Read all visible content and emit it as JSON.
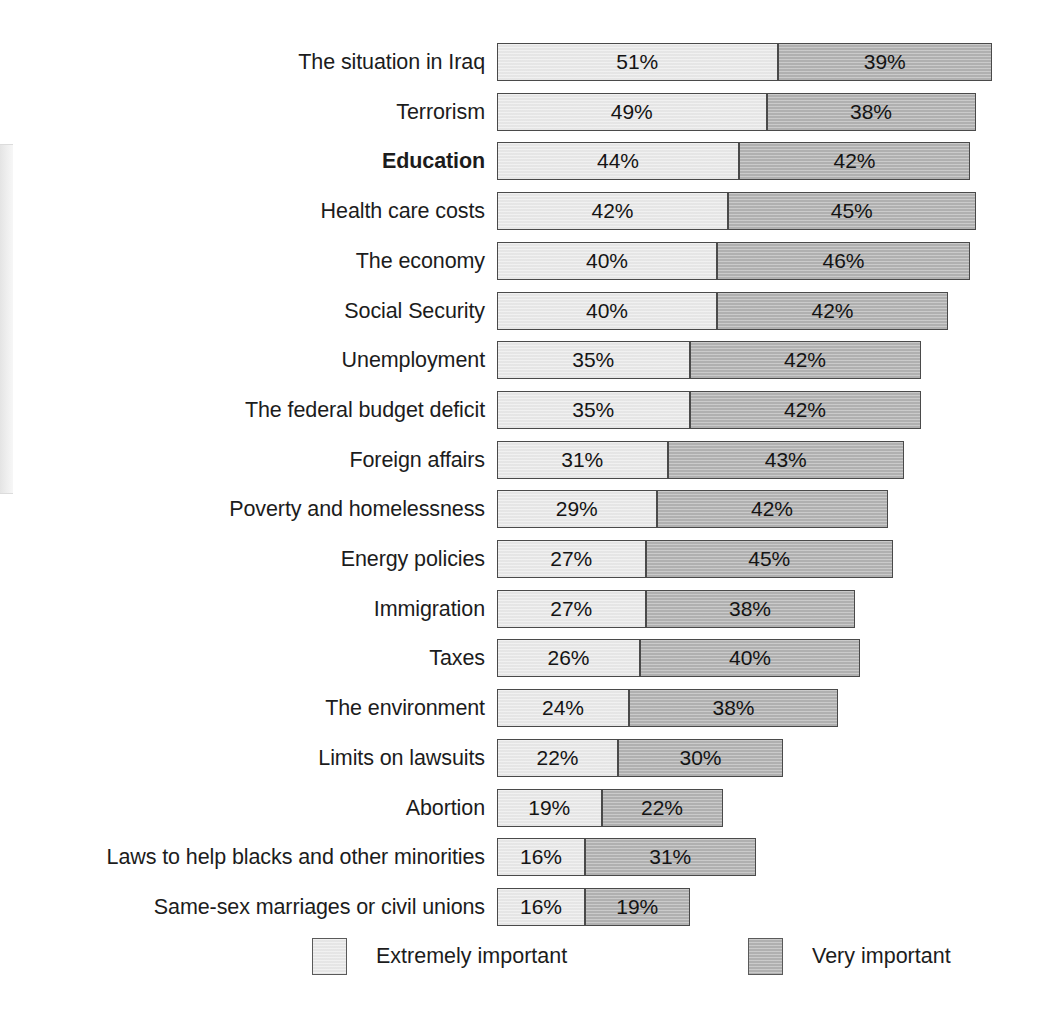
{
  "chart_data": {
    "type": "bar",
    "subtype": "stacked-horizontal",
    "title": "",
    "xlabel": "",
    "ylabel": "",
    "grid": false,
    "xlim": [
      0,
      90
    ],
    "legend_position": "bottom",
    "value_suffix": "%",
    "px_per_percent": 5.5,
    "categories": [
      "The situation in Iraq",
      "Terrorism",
      "Education",
      "Health care costs",
      "The economy",
      "Social Security",
      "Unemployment",
      "The federal budget deficit",
      "Foreign affairs",
      "Poverty and homelessness",
      "Energy policies",
      "Immigration",
      "Taxes",
      "The environment",
      "Limits on lawsuits",
      "Abortion",
      "Laws to help blacks and other minorities",
      "Same-sex marriages or civil unions"
    ],
    "highlight_category": "Education",
    "series": [
      {
        "name": "Extremely important",
        "color": "#ebebeb",
        "values": [
          51,
          49,
          44,
          42,
          40,
          40,
          35,
          35,
          31,
          29,
          27,
          27,
          26,
          24,
          22,
          19,
          16,
          16
        ]
      },
      {
        "name": "Very important",
        "color": "#b4b4b4",
        "values": [
          39,
          38,
          42,
          45,
          46,
          42,
          42,
          42,
          43,
          42,
          45,
          38,
          40,
          38,
          30,
          22,
          31,
          19
        ]
      }
    ],
    "rows": [
      {
        "label": "The situation in Iraq",
        "extremely": "51%",
        "very": "39%",
        "extremely_value": 51,
        "very_value": 39,
        "bold": false
      },
      {
        "label": "Terrorism",
        "extremely": "49%",
        "very": "38%",
        "extremely_value": 49,
        "very_value": 38,
        "bold": false
      },
      {
        "label": "Education",
        "extremely": "44%",
        "very": "42%",
        "extremely_value": 44,
        "very_value": 42,
        "bold": true
      },
      {
        "label": "Health care costs",
        "extremely": "42%",
        "very": "45%",
        "extremely_value": 42,
        "very_value": 45,
        "bold": false
      },
      {
        "label": "The economy",
        "extremely": "40%",
        "very": "46%",
        "extremely_value": 40,
        "very_value": 46,
        "bold": false
      },
      {
        "label": "Social Security",
        "extremely": "40%",
        "very": "42%",
        "extremely_value": 40,
        "very_value": 42,
        "bold": false
      },
      {
        "label": "Unemployment",
        "extremely": "35%",
        "very": "42%",
        "extremely_value": 35,
        "very_value": 42,
        "bold": false
      },
      {
        "label": "The federal budget deficit",
        "extremely": "35%",
        "very": "42%",
        "extremely_value": 35,
        "very_value": 42,
        "bold": false
      },
      {
        "label": "Foreign affairs",
        "extremely": "31%",
        "very": "43%",
        "extremely_value": 31,
        "very_value": 43,
        "bold": false
      },
      {
        "label": "Poverty and homelessness",
        "extremely": "29%",
        "very": "42%",
        "extremely_value": 29,
        "very_value": 42,
        "bold": false
      },
      {
        "label": "Energy policies",
        "extremely": "27%",
        "very": "45%",
        "extremely_value": 27,
        "very_value": 45,
        "bold": false
      },
      {
        "label": "Immigration",
        "extremely": "27%",
        "very": "38%",
        "extremely_value": 27,
        "very_value": 38,
        "bold": false
      },
      {
        "label": "Taxes",
        "extremely": "26%",
        "very": "40%",
        "extremely_value": 26,
        "very_value": 40,
        "bold": false
      },
      {
        "label": "The environment",
        "extremely": "24%",
        "very": "38%",
        "extremely_value": 24,
        "very_value": 38,
        "bold": false
      },
      {
        "label": "Limits on lawsuits",
        "extremely": "22%",
        "very": "30%",
        "extremely_value": 22,
        "very_value": 30,
        "bold": false
      },
      {
        "label": "Abortion",
        "extremely": "19%",
        "very": "22%",
        "extremely_value": 19,
        "very_value": 22,
        "bold": false
      },
      {
        "label": "Laws to help blacks and other minorities",
        "extremely": "16%",
        "very": "31%",
        "extremely_value": 16,
        "very_value": 31,
        "bold": false
      },
      {
        "label": "Same-sex marriages or civil unions",
        "extremely": "16%",
        "very": "19%",
        "extremely_value": 16,
        "very_value": 19,
        "bold": false
      }
    ]
  },
  "legend": {
    "items": [
      {
        "label": "Extremely important",
        "color": "#ebebeb"
      },
      {
        "label": "Very important",
        "color": "#b4b4b4"
      }
    ]
  }
}
